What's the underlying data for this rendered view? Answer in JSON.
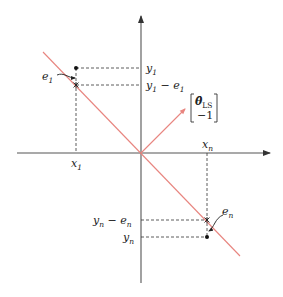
{
  "diagram": {
    "colors": {
      "axes": "#555555",
      "line": "#e8857f",
      "dashed": "#333333",
      "text": "#222222"
    },
    "labels": {
      "y1": "y",
      "y1_sub": "1",
      "y1_minus_e1": "y",
      "y1_minus_e1_sub": "1",
      "y1_minus_e1_rest": " − e",
      "y1_minus_e1_rest_sub": "1",
      "e1": "e",
      "e1_sub": "1",
      "x1": "x",
      "x1_sub": "1",
      "xn": "x",
      "xn_sub": "n",
      "yn_minus_en": "y",
      "yn_minus_en_sub": "n",
      "yn_minus_en_rest": " − e",
      "yn_minus_en_rest_sub": "n",
      "yn": "y",
      "yn_sub": "n",
      "en": "e",
      "en_sub": "n",
      "vector_top": "θ̂",
      "vector_top_sub": "LS",
      "vector_bottom": "−1"
    },
    "elements": {
      "x_axis": "horizontal axis with arrow",
      "y_axis": "vertical axis with arrow",
      "regression_line": "red line through origin with negative slope",
      "normal_vector": "red arrow [θ̂_LS, −1] perpendicular to line",
      "points": [
        {
          "name": "data point 1",
          "x_label": "x1",
          "y_label": "y1",
          "fitted": "y1 − e1",
          "residual": "e1"
        },
        {
          "name": "data point n",
          "x_label": "xn",
          "y_label": "yn",
          "fitted": "yn − en",
          "residual": "en"
        }
      ]
    }
  }
}
